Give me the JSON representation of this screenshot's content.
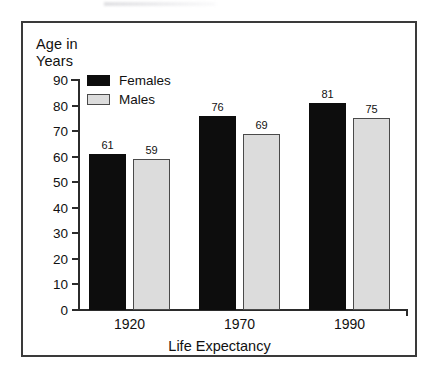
{
  "figure": {
    "frame_color": "#3a3a3a",
    "background": "#ffffff"
  },
  "chart_data": {
    "type": "bar",
    "title": "",
    "subtitle": "",
    "xlabel": "Life Expectancy",
    "ylabel": "Age in\nYears",
    "ylabel_line1": "Age in",
    "ylabel_line2": "Years",
    "categories": [
      "1920",
      "1970",
      "1990"
    ],
    "series": [
      {
        "name": "Females",
        "values": [
          61,
          76,
          81
        ],
        "color": "#0d0d0d",
        "border": "#0d0d0d"
      },
      {
        "name": "Males",
        "values": [
          59,
          69,
          75
        ],
        "color": "#dcdcdc",
        "border": "#4a4a4a"
      }
    ],
    "ylim": [
      0,
      90
    ],
    "ytick_labels": [
      "90",
      "80",
      "70",
      "60",
      "50",
      "40",
      "30",
      "20",
      "10",
      "0"
    ],
    "ytick_values": [
      90,
      80,
      70,
      60,
      50,
      40,
      30,
      20,
      10,
      0
    ],
    "ytick_step": 10,
    "grid": false,
    "data_labels": true,
    "legend": {
      "position": "inside-top-left",
      "entries": [
        {
          "label": "Females",
          "swatch": "solid-black"
        },
        {
          "label": "Males",
          "swatch": "light-gray-outlined"
        }
      ]
    }
  }
}
